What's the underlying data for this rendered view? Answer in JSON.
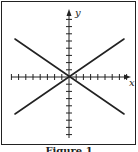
{
  "figure": {
    "caption": "Figure 1",
    "axes": {
      "x_label": "x",
      "y_label": "y",
      "x_ticks_each_side": 8,
      "y_ticks_each_side": 8
    },
    "lines": [
      {
        "name": "line-negative-slope",
        "from": [
          -7,
          5
        ],
        "to": [
          7,
          -5
        ]
      },
      {
        "name": "line-positive-slope",
        "from": [
          -7,
          -5
        ],
        "to": [
          7,
          5
        ]
      }
    ],
    "colors": {
      "stroke": "#222222",
      "background": "#ffffff"
    }
  }
}
